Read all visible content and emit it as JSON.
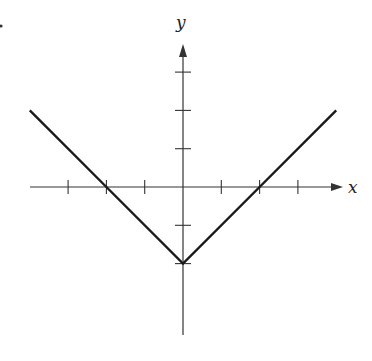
{
  "chart_data": {
    "type": "line",
    "title": "",
    "xlabel": "x",
    "ylabel": "y",
    "function": "y = |x| - 2",
    "x": [
      -4,
      -2,
      0,
      2,
      4
    ],
    "y": [
      2,
      0,
      -2,
      0,
      2
    ],
    "xlim": [
      -4.1,
      4.3
    ],
    "ylim": [
      -3.4,
      3.7
    ],
    "x_ticks": [
      -3,
      -2,
      -1,
      1,
      2,
      3
    ],
    "y_ticks": [
      -2,
      -1,
      1,
      2,
      3
    ],
    "tick_labels_shown": false,
    "grid": false,
    "legend": "none"
  },
  "labels": {
    "x_axis": "x",
    "y_axis": "y"
  },
  "colors": {
    "line": "#1a1a1a",
    "axis": "#333333"
  }
}
